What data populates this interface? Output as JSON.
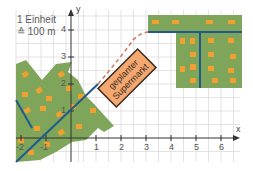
{
  "legend": {
    "line1": "1 Einheit",
    "line2": "≙ 100 m"
  },
  "axes": {
    "x_label": "x",
    "y_label": "y",
    "x_ticks": [
      "-2",
      "-1",
      "1",
      "2",
      "3",
      "4",
      "5",
      "6"
    ],
    "y_ticks": [
      "1",
      "2",
      "3",
      "4"
    ]
  },
  "supermarket": {
    "line1": "geplanter",
    "line2": "Supermarkt"
  },
  "colors": {
    "grid": "#d8d8d8",
    "axis": "#333333",
    "green_area": "#7ea55a",
    "houses": "#f0a030",
    "road": "#1f5a8c",
    "planned_road": "#d2785a",
    "supermarket_fill": "#f4a870",
    "supermarket_border": "#3a2a20"
  }
}
